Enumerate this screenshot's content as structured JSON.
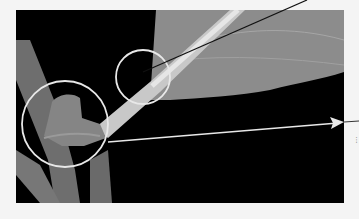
{
  "figure": {
    "callouts": [
      {
        "name": "petiole-base-circle",
        "cx": 143,
        "cy": 77,
        "r": 27
      },
      {
        "name": "node-circle",
        "cx": 65,
        "cy": 124,
        "r": 43
      }
    ],
    "leader_lines": [
      {
        "name": "petiole-leader",
        "from": [
          143,
          70
        ],
        "to": [
          307,
          0
        ]
      },
      {
        "name": "node-leader-arrow",
        "from": [
          108,
          142
        ],
        "to": [
          344,
          122
        ]
      }
    ],
    "edge_mark": "⋮",
    "colors": {
      "background": "#f4f4f4",
      "photo_bg": "#000000",
      "leaf": "#8a8a8a",
      "stem": "#7a7a7a",
      "callout": "#e8e8e8",
      "leader": "#111111"
    }
  }
}
